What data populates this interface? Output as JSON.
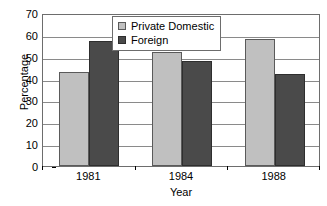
{
  "chart_data": {
    "type": "bar",
    "title": "",
    "xlabel": "Year",
    "ylabel": "Percentage",
    "categories": [
      "1981",
      "1984",
      "1988"
    ],
    "series": [
      {
        "name": "Private Domestic",
        "values": [
          43,
          52,
          58
        ],
        "color": "#c0c0c0"
      },
      {
        "name": "Foreign",
        "values": [
          57,
          48,
          42
        ],
        "color": "#4a4a4a"
      }
    ],
    "ylim": [
      0,
      70
    ],
    "ytick_step": 10,
    "yticks": [
      0,
      10,
      20,
      30,
      40,
      50,
      60,
      70
    ],
    "ytick_labels": [
      "0",
      "10",
      "20",
      "30",
      "40",
      "50",
      "60",
      "70"
    ],
    "grid": "horizontal",
    "legend_position": "top-center",
    "plot_border": true,
    "bar_group_gap": true
  },
  "axes": {
    "y_title": "Percentage",
    "x_title": "Year"
  },
  "legend": {
    "entries": [
      {
        "label": "Private Domestic",
        "swatch": "legend-swatch-private-domestic"
      },
      {
        "label": "Foreign",
        "swatch": "legend-swatch-foreign"
      }
    ]
  }
}
